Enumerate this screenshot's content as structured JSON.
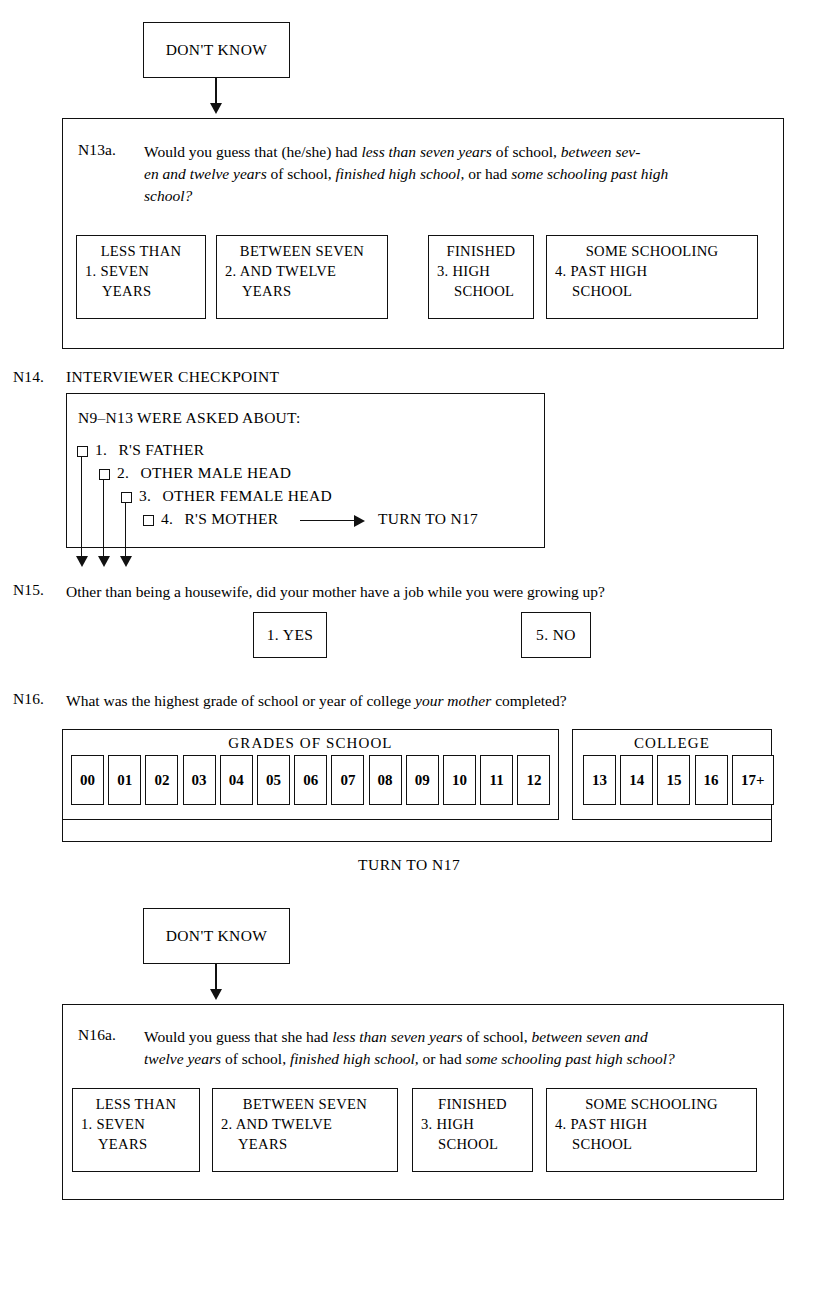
{
  "document": {
    "title": "Survey Questionnaire — Parental Education Skip Pattern"
  },
  "dont_know_1": {
    "label": "DON'T KNOW"
  },
  "n13a": {
    "number": "N13a.",
    "text_html": "Would you guess that (he/she) had <i>less than seven years</i> of school, <i>between sev-</i><br><i>en and twelve years</i> of school, <i>finished high school,</i> or had <i>some schooling past high</i><br><i>school?</i>",
    "options": [
      {
        "code": "1.",
        "line1": "LESS THAN",
        "line2": "1. SEVEN",
        "line3": "YEARS"
      },
      {
        "code": "2.",
        "line1": "BETWEEN SEVEN",
        "line2": "2. AND TWELVE",
        "line3": "YEARS"
      },
      {
        "code": "3.",
        "line1": "FINISHED",
        "line2": "3. HIGH",
        "line3": "SCHOOL"
      },
      {
        "code": "4.",
        "line1": "SOME SCHOOLING",
        "line2": "4. PAST HIGH",
        "line3": "SCHOOL"
      }
    ]
  },
  "n14": {
    "number": "N14.",
    "title": "INTERVIEWER CHECKPOINT",
    "heading": "N9–N13 WERE ASKED ABOUT:",
    "items": [
      {
        "num": "1.",
        "label": "R'S FATHER"
      },
      {
        "num": "2.",
        "label": "OTHER MALE HEAD"
      },
      {
        "num": "3.",
        "label": "OTHER FEMALE HEAD"
      },
      {
        "num": "4.",
        "label": "R'S MOTHER"
      }
    ],
    "goto_label": "TURN TO N17"
  },
  "n15": {
    "number": "N15.",
    "text": "Other than being a housewife, did your mother have a job while you were growing up?",
    "yes": "1.  YES",
    "no": "5.  NO"
  },
  "n16": {
    "number": "N16.",
    "text_html": "What was the highest grade of school or year of college <i>your mother</i> completed?",
    "grades_title": "GRADES OF SCHOOL",
    "grades": [
      "00",
      "01",
      "02",
      "03",
      "04",
      "05",
      "06",
      "07",
      "08",
      "09",
      "10",
      "11",
      "12"
    ],
    "college_title": "COLLEGE",
    "college": [
      "13",
      "14",
      "15",
      "16",
      "17+"
    ],
    "turn_label": "TURN TO N17"
  },
  "dont_know_2": {
    "label": "DON'T KNOW"
  },
  "n16a": {
    "number": "N16a.",
    "text_html": "Would you guess that she had <i>less than seven years</i> of school, <i>between seven and</i><br><i>twelve years</i> of school, <i>finished high school,</i> or had <i>some schooling past high school?</i>",
    "options": [
      {
        "code": "1.",
        "line1": "LESS THAN",
        "line2": "1. SEVEN",
        "line3": "YEARS"
      },
      {
        "code": "2.",
        "line1": "BETWEEN SEVEN",
        "line2": "2. AND TWELVE",
        "line3": "YEARS"
      },
      {
        "code": "3.",
        "line1": "FINISHED",
        "line2": "3. HIGH",
        "line3": "SCHOOL"
      },
      {
        "code": "4.",
        "line1": "SOME SCHOOLING",
        "line2": "4. PAST HIGH",
        "line3": "SCHOOL"
      }
    ]
  },
  "colors": {
    "ink": "#111111",
    "paper": "#ffffff"
  }
}
